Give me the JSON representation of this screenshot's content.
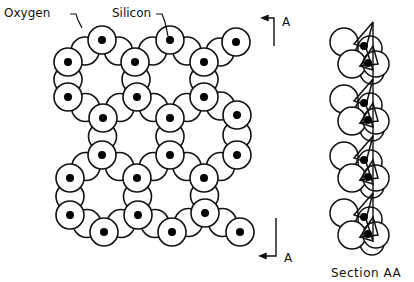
{
  "diagram": {
    "type": "silicate-sheet-structure",
    "labels": {
      "oxygen": "Oxygen",
      "silicon": "Silicon",
      "section_marker_top": "A",
      "section_marker_bottom": "A",
      "section_caption": "Section AA"
    },
    "colors": {
      "stroke": "#111111",
      "background": "#ffffff",
      "silicon_dot": "#000000"
    },
    "plan_view": {
      "silicon_centers": [
        [
          102,
          40
        ],
        [
          170,
          40
        ],
        [
          236,
          42
        ],
        [
          68,
          62
        ],
        [
          135,
          62
        ],
        [
          204,
          62
        ],
        [
          68,
          97
        ],
        [
          137,
          97
        ],
        [
          204,
          97
        ],
        [
          103,
          118
        ],
        [
          170,
          118
        ],
        [
          237,
          115
        ],
        [
          102,
          155
        ],
        [
          170,
          155
        ],
        [
          237,
          155
        ],
        [
          70,
          178
        ],
        [
          137,
          178
        ],
        [
          204,
          178
        ],
        [
          70,
          215
        ],
        [
          138,
          215
        ],
        [
          205,
          213
        ],
        [
          104,
          232
        ],
        [
          172,
          232
        ],
        [
          240,
          232
        ]
      ],
      "oxygen_radius": 14,
      "silicon_ring_radius": 14,
      "silicon_dot_radius": 4
    },
    "section_view": {
      "axis_x": 373,
      "axis_top": 22,
      "axis_bottom": 240,
      "repeat_offsets": [
        0,
        57,
        114,
        171
      ]
    }
  }
}
